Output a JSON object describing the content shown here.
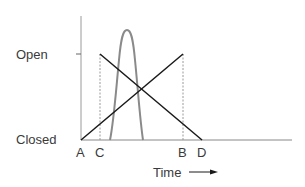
{
  "diagram": {
    "y_labels": {
      "open": "Open",
      "closed": "Closed"
    },
    "x_labels": {
      "a": "A",
      "c": "C",
      "b": "B",
      "d": "D"
    },
    "axis_label": "Time",
    "colors": {
      "lines": "#1a1a1a",
      "bell": "#8a8a8a",
      "axis": "#9a9a9a",
      "guides": "#9a9a9a"
    },
    "icons": {
      "arrow": "right-arrow-icon"
    }
  }
}
